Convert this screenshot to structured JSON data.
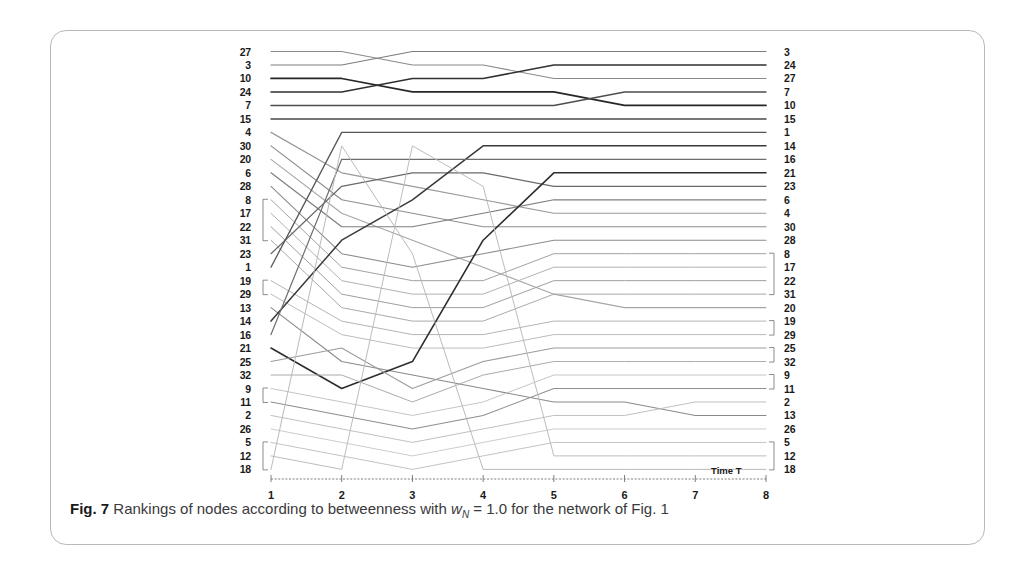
{
  "figure": {
    "caption_prefix": "Fig. 7",
    "caption_part1": "Rankings of nodes according to betweenness with",
    "caption_var": "w",
    "caption_var_sub": "N",
    "caption_part2": "= 1.0 for the network of Fig. 1"
  },
  "axis": {
    "x_title": "Time T",
    "x_ticks": [
      "1",
      "2",
      "3",
      "4",
      "5",
      "6",
      "7",
      "8"
    ]
  },
  "left_labels": [
    "27",
    "3",
    "10",
    "24",
    "7",
    "15",
    "4",
    "30",
    "20",
    "6",
    "28",
    "8",
    "17",
    "22",
    "31",
    "23",
    "1",
    "19",
    "29",
    "13",
    "14",
    "16",
    "21",
    "25",
    "32",
    "9",
    "11",
    "2",
    "26",
    "5",
    "12",
    "18"
  ],
  "right_labels": [
    "3",
    "24",
    "27",
    "7",
    "10",
    "15",
    "1",
    "14",
    "16",
    "21",
    "23",
    "6",
    "4",
    "30",
    "28",
    "8",
    "17",
    "22",
    "31",
    "20",
    "19",
    "29",
    "25",
    "32",
    "9",
    "11",
    "2",
    "13",
    "26",
    "5",
    "12",
    "18"
  ],
  "chart_data": {
    "type": "line",
    "xlabel": "Time T",
    "ylabel": "Rank",
    "x": [
      1,
      2,
      3,
      4,
      5,
      6,
      7,
      8
    ],
    "ylim": [
      1,
      32
    ],
    "y_inverted": true,
    "grid": false,
    "legend": "none",
    "note": "Bump chart: each series is a node; values are its rank (1 = top) at each of 8 time steps. Left axis labels are ranks at T=1, right axis labels are ranks at T=8.",
    "series": [
      {
        "name": "27",
        "values": [
          1,
          1,
          2,
          2,
          3,
          3,
          3,
          3
        ]
      },
      {
        "name": "3",
        "values": [
          2,
          2,
          1,
          1,
          1,
          1,
          1,
          1
        ]
      },
      {
        "name": "10",
        "values": [
          3,
          3,
          4,
          4,
          4,
          5,
          5,
          5
        ]
      },
      {
        "name": "24",
        "values": [
          4,
          4,
          3,
          3,
          2,
          2,
          2,
          2
        ]
      },
      {
        "name": "7",
        "values": [
          5,
          5,
          5,
          5,
          5,
          4,
          4,
          4
        ]
      },
      {
        "name": "15",
        "values": [
          6,
          6,
          6,
          6,
          6,
          6,
          6,
          6
        ]
      },
      {
        "name": "4",
        "values": [
          7,
          10,
          11,
          12,
          13,
          13,
          13,
          13
        ]
      },
      {
        "name": "30",
        "values": [
          8,
          12,
          13,
          14,
          14,
          14,
          14,
          14
        ]
      },
      {
        "name": "20",
        "values": [
          9,
          13,
          15,
          17,
          19,
          20,
          20,
          20
        ]
      },
      {
        "name": "6",
        "values": [
          10,
          14,
          14,
          13,
          12,
          12,
          12,
          12
        ]
      },
      {
        "name": "28",
        "values": [
          11,
          16,
          17,
          16,
          15,
          15,
          15,
          15
        ]
      },
      {
        "name": "8",
        "values": [
          12,
          17,
          18,
          18,
          16,
          16,
          16,
          16
        ]
      },
      {
        "name": "17",
        "values": [
          13,
          18,
          19,
          19,
          17,
          17,
          17,
          17
        ]
      },
      {
        "name": "22",
        "values": [
          14,
          19,
          20,
          20,
          18,
          18,
          18,
          18
        ]
      },
      {
        "name": "31",
        "values": [
          15,
          20,
          21,
          21,
          19,
          19,
          19,
          19
        ]
      },
      {
        "name": "23",
        "values": [
          16,
          11,
          10,
          10,
          11,
          11,
          11,
          11
        ]
      },
      {
        "name": "1",
        "values": [
          17,
          7,
          7,
          7,
          7,
          7,
          7,
          7
        ]
      },
      {
        "name": "19",
        "values": [
          18,
          21,
          22,
          22,
          21,
          21,
          21,
          21
        ]
      },
      {
        "name": "29",
        "values": [
          19,
          22,
          23,
          23,
          22,
          22,
          22,
          22
        ]
      },
      {
        "name": "13",
        "values": [
          20,
          24,
          25,
          26,
          27,
          27,
          28,
          28
        ]
      },
      {
        "name": "14",
        "values": [
          21,
          15,
          12,
          8,
          8,
          8,
          8,
          8
        ]
      },
      {
        "name": "16",
        "values": [
          22,
          9,
          9,
          9,
          9,
          9,
          9,
          9
        ]
      },
      {
        "name": "21",
        "values": [
          23,
          26,
          24,
          15,
          10,
          10,
          10,
          10
        ]
      },
      {
        "name": "25",
        "values": [
          24,
          23,
          26,
          24,
          23,
          23,
          23,
          23
        ]
      },
      {
        "name": "32",
        "values": [
          25,
          25,
          27,
          25,
          24,
          24,
          24,
          24
        ]
      },
      {
        "name": "9",
        "values": [
          26,
          27,
          28,
          27,
          25,
          25,
          25,
          25
        ]
      },
      {
        "name": "11",
        "values": [
          27,
          28,
          29,
          28,
          26,
          26,
          26,
          26
        ]
      },
      {
        "name": "2",
        "values": [
          28,
          29,
          30,
          29,
          28,
          28,
          27,
          27
        ]
      },
      {
        "name": "26",
        "values": [
          29,
          30,
          31,
          30,
          29,
          29,
          29,
          29
        ]
      },
      {
        "name": "5",
        "values": [
          30,
          31,
          32,
          31,
          30,
          30,
          30,
          30
        ]
      },
      {
        "name": "12",
        "values": [
          31,
          32,
          8,
          11,
          31,
          31,
          31,
          31
        ]
      },
      {
        "name": "18",
        "values": [
          32,
          8,
          16,
          32,
          32,
          32,
          32,
          32
        ]
      }
    ]
  },
  "ties": {
    "left_brackets": [
      {
        "start_index": 11,
        "end_index": 14
      },
      {
        "start_index": 17,
        "end_index": 18
      },
      {
        "start_index": 25,
        "end_index": 26
      },
      {
        "start_index": 29,
        "end_index": 31
      }
    ],
    "right_brackets": [
      {
        "start_index": 15,
        "end_index": 18
      },
      {
        "start_index": 20,
        "end_index": 21
      },
      {
        "start_index": 22,
        "end_index": 23
      },
      {
        "start_index": 24,
        "end_index": 25
      },
      {
        "start_index": 29,
        "end_index": 31
      }
    ]
  },
  "colors": {
    "frame": "#b9b9bb",
    "caption_text": "#3a3a3c",
    "label_text": "#1a1a1a",
    "line_dark": "#2b2b2b",
    "line_mid": "#6e6e6e",
    "line_light": "#b0b0b0"
  }
}
